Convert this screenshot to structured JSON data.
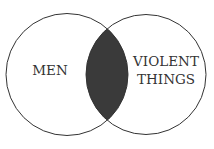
{
  "diagram": {
    "type": "venn",
    "sets": [
      {
        "id": "left",
        "label_lines": [
          "MEN"
        ]
      },
      {
        "id": "right",
        "label_lines": [
          "VIOLENT",
          "THINGS"
        ]
      }
    ],
    "intersection": {
      "shaded": true,
      "fill": "#3a3a3a"
    },
    "colors": {
      "stroke": "#333333",
      "background": "#ffffff",
      "text": "#333333"
    }
  }
}
